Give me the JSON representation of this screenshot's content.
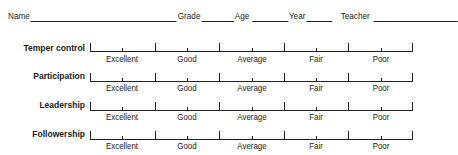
{
  "header": {
    "fields": [
      {
        "label": "Name",
        "blank_width": 170
      },
      {
        "label": "Grade",
        "blank_width": 32
      },
      {
        "label": "Age",
        "blank_width": 38
      },
      {
        "label": "Year",
        "blank_width": 26
      },
      {
        "label": "Teacher",
        "blank_width": 84
      }
    ]
  },
  "scale_options": [
    "Excellent",
    "Good",
    "Average",
    "Fair",
    "Poor"
  ],
  "rows": [
    {
      "label": "Temper control",
      "options": [
        "Excellent",
        "Good",
        "Average",
        "Fair",
        "Poor"
      ]
    },
    {
      "label": "Participation",
      "options": [
        "Excellent",
        "Good",
        "Average",
        "Fair",
        "Poor"
      ]
    },
    {
      "label": "Leadership",
      "options": [
        "Excellent",
        "Good",
        "Average",
        "Fair",
        "Poor"
      ]
    },
    {
      "label": "Followership",
      "options": [
        "Excellent",
        "Good",
        "Average",
        "Fair",
        "Poor"
      ]
    }
  ]
}
